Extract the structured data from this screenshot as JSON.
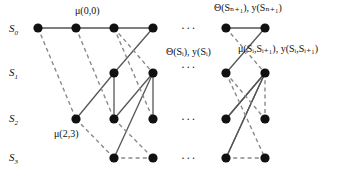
{
  "figure": {
    "width": 339,
    "height": 177,
    "background": "#ffffff",
    "node_color": "#111111",
    "solid_edge_color": "#555555",
    "dashed_edge_color": "#8a8a8a"
  },
  "row_labels": [
    {
      "name": "S",
      "subscript": "0",
      "x": 9,
      "y": 23
    },
    {
      "name": "S",
      "subscript": "1",
      "x": 9,
      "y": 67
    },
    {
      "name": "S",
      "subscript": "2",
      "x": 9,
      "y": 113
    },
    {
      "name": "S",
      "subscript": "3",
      "x": 9,
      "y": 152
    }
  ],
  "annotations": [
    {
      "id": "mu-0-0",
      "text": "μ(0,0)",
      "x": 75,
      "y": 6
    },
    {
      "id": "theta-y-Sn1",
      "text": "Θ(Sₙ₊₁), y(Sₙ₊₁)",
      "x": 214,
      "y": 3
    },
    {
      "id": "theta-y-Si",
      "text": "Θ(Sᵢ), y(Sᵢ)",
      "x": 166,
      "y": 47
    },
    {
      "id": "mu-y-Si-Si1",
      "text": "μ(Sᵢ,Sᵢ₊₁), y(Sᵢ,Sᵢ₊₁)",
      "x": 238,
      "y": 44
    },
    {
      "id": "mu-2-3",
      "text": "μ(2,3)",
      "x": 54,
      "y": 129
    }
  ],
  "ellipses": [
    {
      "id": "ellipsis-row0",
      "text": "···",
      "x": 181,
      "y": 22
    },
    {
      "id": "ellipsis-row1",
      "text": "···",
      "x": 181,
      "y": 61
    },
    {
      "id": "ellipsis-row2",
      "text": "···",
      "x": 181,
      "y": 113
    },
    {
      "id": "ellipsis-row3",
      "text": "···",
      "x": 181,
      "y": 152
    }
  ],
  "nodes": [
    {
      "id": "n0a",
      "row": 0,
      "x": 38,
      "y": 28
    },
    {
      "id": "n0b",
      "row": 0,
      "x": 76,
      "y": 28
    },
    {
      "id": "n0c",
      "row": 0,
      "x": 114,
      "y": 28
    },
    {
      "id": "n0d",
      "row": 0,
      "x": 153,
      "y": 28
    },
    {
      "id": "n1c",
      "row": 1,
      "x": 114,
      "y": 73
    },
    {
      "id": "n1d",
      "row": 1,
      "x": 153,
      "y": 73
    },
    {
      "id": "n2b",
      "row": 2,
      "x": 76,
      "y": 119
    },
    {
      "id": "n2c",
      "row": 2,
      "x": 114,
      "y": 119
    },
    {
      "id": "n2d",
      "row": 2,
      "x": 153,
      "y": 119
    },
    {
      "id": "n3c",
      "row": 3,
      "x": 114,
      "y": 158
    },
    {
      "id": "n3d",
      "row": 3,
      "x": 153,
      "y": 158
    },
    {
      "id": "r0a",
      "row": 0,
      "x": 226,
      "y": 28
    },
    {
      "id": "r0b",
      "row": 0,
      "x": 265,
      "y": 28
    },
    {
      "id": "r1a",
      "row": 1,
      "x": 226,
      "y": 73
    },
    {
      "id": "r1b",
      "row": 1,
      "x": 265,
      "y": 73
    },
    {
      "id": "r2a",
      "row": 2,
      "x": 226,
      "y": 119
    },
    {
      "id": "r2b",
      "row": 2,
      "x": 265,
      "y": 119
    },
    {
      "id": "r3a",
      "row": 3,
      "x": 226,
      "y": 158
    },
    {
      "id": "r3b",
      "row": 3,
      "x": 265,
      "y": 158
    }
  ],
  "edges": [
    {
      "from": "n0a",
      "to": "n0b",
      "style": "solid"
    },
    {
      "from": "n0b",
      "to": "n0c",
      "style": "solid"
    },
    {
      "from": "n0c",
      "to": "n0d",
      "style": "solid"
    },
    {
      "from": "n0d",
      "to": "n1c",
      "style": "solid"
    },
    {
      "from": "n1c",
      "to": "n2c",
      "style": "solid"
    },
    {
      "from": "n1d",
      "to": "n2c",
      "style": "solid"
    },
    {
      "from": "n1d",
      "to": "n2d",
      "style": "solid"
    },
    {
      "from": "n1d",
      "to": "n3c",
      "style": "solid"
    },
    {
      "from": "n2b",
      "to": "n1c",
      "style": "solid"
    },
    {
      "from": "n2c",
      "to": "n3d",
      "style": "dashed"
    },
    {
      "from": "n3c",
      "to": "n3d",
      "style": "dashed"
    },
    {
      "from": "n0a",
      "to": "n2b",
      "style": "dashed"
    },
    {
      "from": "n0b",
      "to": "n2c",
      "style": "dashed"
    },
    {
      "from": "n0c",
      "to": "n1d",
      "style": "dashed"
    },
    {
      "from": "n0c",
      "to": "n2d",
      "style": "dashed"
    },
    {
      "from": "n2b",
      "to": "n3c",
      "style": "dashed"
    },
    {
      "from": "r0a",
      "to": "r0b",
      "style": "solid"
    },
    {
      "from": "r0b",
      "to": "r1a",
      "style": "solid"
    },
    {
      "from": "r1b",
      "to": "r2a",
      "style": "solid"
    },
    {
      "from": "r1b",
      "to": "r3a",
      "style": "solid"
    },
    {
      "from": "r2a",
      "to": "r1b",
      "style": "solid"
    },
    {
      "from": "r3a",
      "to": "r1b",
      "style": "solid"
    },
    {
      "from": "r0a",
      "to": "r1b",
      "style": "dashed"
    },
    {
      "from": "r1a",
      "to": "r2b",
      "style": "dashed"
    },
    {
      "from": "r1b",
      "to": "r2b",
      "style": "dashed"
    },
    {
      "from": "r1a",
      "to": "r3b",
      "style": "dashed"
    },
    {
      "from": "r3a",
      "to": "r3b",
      "style": "dashed"
    }
  ]
}
